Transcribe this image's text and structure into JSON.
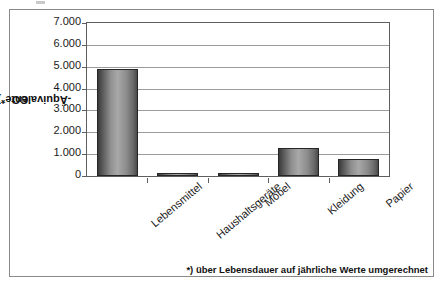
{
  "chart_data": {
    "type": "bar",
    "title": "",
    "subtitle": "",
    "xlabel": "",
    "ylabel": "CO2-Äquivalente*) in t/a",
    "ylabel_parts": {
      "prefix": "CO",
      "subscript": "2",
      "suffix": "-Äquivalente*) in t/a"
    },
    "categories": [
      "Lebensmittel",
      "Haushaltsgeräte",
      "Möbel",
      "Kleidung",
      "Papier"
    ],
    "values": [
      4900,
      100,
      100,
      1300,
      800
    ],
    "ylim": [
      0,
      7000
    ],
    "ytick_values": [
      0,
      1000,
      2000,
      3000,
      4000,
      5000,
      6000,
      7000
    ],
    "ytick_labels": [
      "0",
      "1.000",
      "2.000",
      "3.000",
      "4.000",
      "5.000",
      "6.000",
      "7.000"
    ],
    "grid": true,
    "legend": false,
    "legend_position": "none",
    "series": [
      {
        "name": "CO2-Äquivalente",
        "values": [
          4900,
          100,
          100,
          1300,
          800
        ]
      }
    ]
  },
  "footnote": {
    "text": "*) über Lebensdauer auf jährliche Werte umgerechnet"
  },
  "colors": {
    "bar_fill_light": "#a8a8a8",
    "bar_fill_dark": "#3a3a3a",
    "bar_border": "#262626",
    "gridline": "#9b9b9b",
    "axis": "#5e5e5e",
    "frame": "#8a8a8a",
    "text": "#1a1a1a",
    "background": "#ffffff"
  }
}
